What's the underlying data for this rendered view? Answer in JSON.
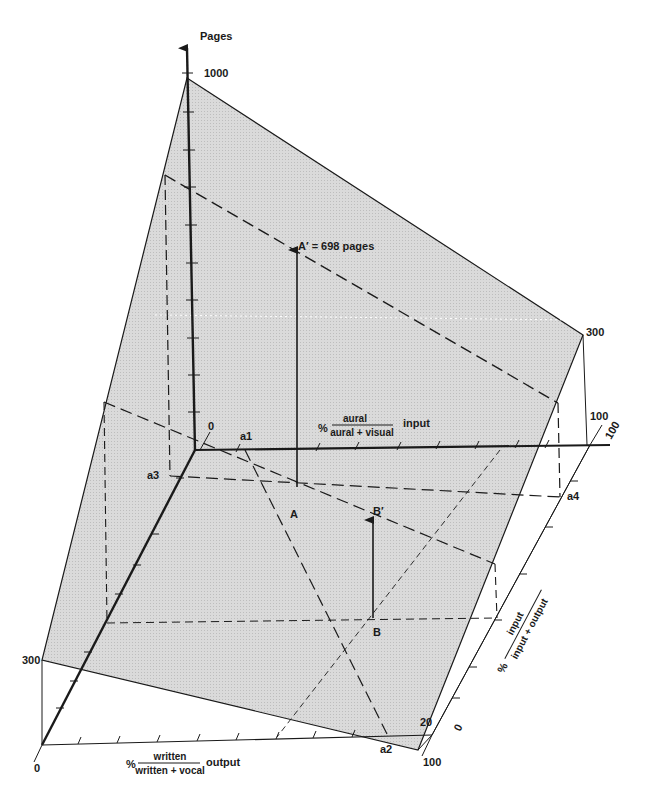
{
  "diagram": {
    "title": "",
    "colors": {
      "plane_fill": "#d6d6d6",
      "line": "#1a1a1a",
      "background": "#ffffff"
    },
    "axes": {
      "vertical": {
        "label": "Pages",
        "top_value": "1000",
        "origin_value": "0"
      },
      "input_axis": {
        "prefix": "%",
        "numerator": "aural",
        "denominator": "aural + visual",
        "suffix": "input",
        "end_value": "100",
        "point_label": "a1"
      },
      "output_axis": {
        "prefix": "%",
        "numerator": "written",
        "denominator": "written + vocal",
        "suffix": "output",
        "start_value": "0",
        "end_value": "100",
        "point_label": "a2"
      },
      "ratio_axis": {
        "prefix": "%",
        "numerator": "input",
        "denominator": "input + output",
        "start_value": "0",
        "end_value": "100"
      }
    },
    "plane_corner_values": {
      "left": "300",
      "right": "300",
      "bottom_right": "20",
      "right_lower": "100"
    },
    "points": {
      "a3": "a3",
      "a4": "a4",
      "A": "A",
      "A_prime": "A′ = 698 pages",
      "B": "B",
      "B_prime": "B′"
    }
  }
}
